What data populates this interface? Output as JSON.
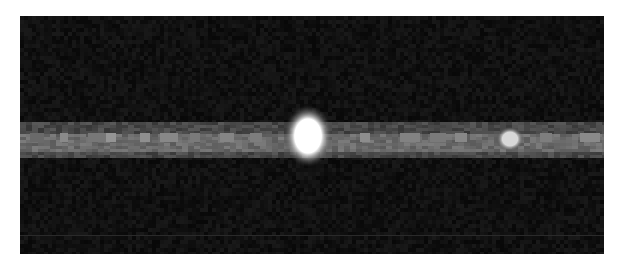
{
  "image": {
    "description": "Grayscale dark frame with a horizontal bright streak (spectral trace) containing one very bright spot and one fainter spot",
    "background_color": "#0d0d0d",
    "page_background": "#ffffff",
    "panel": {
      "x": 20,
      "y": 16,
      "width": 584,
      "height": 238
    },
    "band": {
      "y_top": 122,
      "y_bottom": 156,
      "core_top": 133,
      "core_bottom": 150,
      "color": "#5a5a5a",
      "core_color": "#7d7d7d"
    },
    "faint_line": {
      "y": 235,
      "color": "#2a2a2a"
    },
    "bright_spot": {
      "cx": 308,
      "cy": 136,
      "rx": 18,
      "ry": 23,
      "color": "#ffffff"
    },
    "secondary_spot": {
      "cx": 510,
      "cy": 139,
      "rx": 10,
      "ry": 9,
      "color": "#d8d8d8"
    },
    "band_segments": [
      {
        "x": 30,
        "w": 14,
        "v": "#6a6a6a"
      },
      {
        "x": 60,
        "w": 8,
        "v": "#8a8a8a"
      },
      {
        "x": 88,
        "w": 18,
        "v": "#777777"
      },
      {
        "x": 106,
        "w": 10,
        "v": "#959595"
      },
      {
        "x": 140,
        "w": 10,
        "v": "#8f8f8f"
      },
      {
        "x": 160,
        "w": 18,
        "v": "#888888"
      },
      {
        "x": 190,
        "w": 10,
        "v": "#7a7a7a"
      },
      {
        "x": 220,
        "w": 14,
        "v": "#858585"
      },
      {
        "x": 250,
        "w": 12,
        "v": "#7d7d7d"
      },
      {
        "x": 360,
        "w": 10,
        "v": "#8d8d8d"
      },
      {
        "x": 400,
        "w": 20,
        "v": "#828282"
      },
      {
        "x": 430,
        "w": 16,
        "v": "#7a7a7a"
      },
      {
        "x": 455,
        "w": 12,
        "v": "#888888"
      },
      {
        "x": 540,
        "w": 12,
        "v": "#7e7e7e"
      },
      {
        "x": 580,
        "w": 20,
        "v": "#8a8a8a"
      }
    ]
  }
}
